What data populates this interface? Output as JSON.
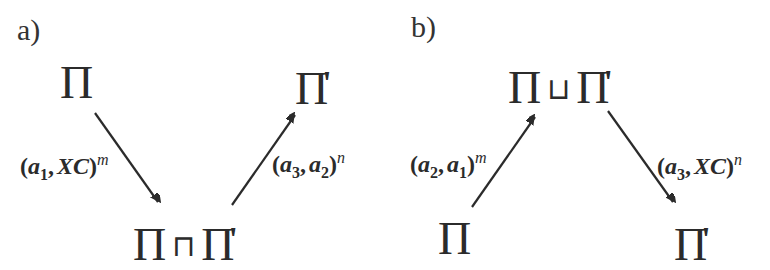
{
  "diagram": {
    "colors": {
      "background": "#ffffff",
      "ink": "#2b2b2b"
    },
    "panels": [
      {
        "label": "a)",
        "nodes": {
          "top_left": {
            "base": "Π",
            "prime": ""
          },
          "top_right": {
            "base": "Π",
            "prime": "'"
          },
          "bottom": {
            "left": "Π",
            "operator": "⊓",
            "right": "Π",
            "right_prime": "'"
          }
        },
        "edges": [
          {
            "from": "Π",
            "to": "Π ⊓ Π'",
            "label": {
              "open": "(",
              "first": "a",
              "first_sub": "1",
              "sep": ",",
              "second": "XC",
              "second_sub": "",
              "close": ")",
              "sup": "m"
            }
          },
          {
            "from": "Π ⊓ Π'",
            "to": "Π'",
            "label": {
              "open": "(",
              "first": "a",
              "first_sub": "3",
              "sep": ",",
              "second": "a",
              "second_sub": "2",
              "close": ")",
              "sup": "n"
            }
          }
        ]
      },
      {
        "label": "b)",
        "nodes": {
          "top": {
            "left": "Π",
            "operator": "⊔",
            "right": "Π",
            "right_prime": "'"
          },
          "bottom_left": {
            "base": "Π",
            "prime": ""
          },
          "bottom_right": {
            "base": "Π",
            "prime": "'"
          }
        },
        "edges": [
          {
            "from": "Π",
            "to": "Π ⊔ Π'",
            "label": {
              "open": "(",
              "first": "a",
              "first_sub": "2",
              "sep": ",",
              "second": "a",
              "second_sub": "1",
              "close": ")",
              "sup": "m"
            }
          },
          {
            "from": "Π ⊔ Π'",
            "to": "Π'",
            "label": {
              "open": "(",
              "first": "a",
              "first_sub": "3",
              "sep": ",",
              "second": "XC",
              "second_sub": "",
              "close": ")",
              "sup": "n"
            }
          }
        ]
      }
    ]
  }
}
